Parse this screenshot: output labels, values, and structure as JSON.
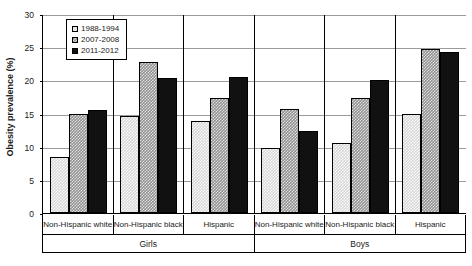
{
  "chart_data": {
    "type": "bar",
    "title": "",
    "xlabel": "",
    "ylabel": "Obesity prevalence (%)",
    "ylim": [
      0,
      30
    ],
    "ytick_step": 5,
    "yticks": [
      0,
      5,
      10,
      15,
      20,
      25,
      30
    ],
    "grid": true,
    "legend_position": "top-left-inside",
    "categories": [
      "Non-Hispanic white",
      "Non-Hispanic black",
      "Hispanic",
      "Non-Hispanic white",
      "Non-Hispanic black",
      "Hispanic"
    ],
    "group_labels": [
      "Girls",
      "Boys"
    ],
    "group_spans": [
      3,
      3
    ],
    "series": [
      {
        "name": "1988-1994",
        "swatch": "light-checker",
        "values": [
          8.4,
          14.6,
          13.8,
          9.8,
          10.6,
          15.0
        ]
      },
      {
        "name": "2007-2008",
        "swatch": "dark-checker",
        "values": [
          15.0,
          22.8,
          17.3,
          15.7,
          17.4,
          24.7
        ]
      },
      {
        "name": "2011-2012",
        "swatch": "solid-black",
        "values": [
          15.6,
          20.4,
          20.5,
          12.4,
          20.0,
          24.3
        ]
      }
    ]
  },
  "colors": {
    "series_1": "#d6d6d6",
    "series_2": "#8f8f8f",
    "series_3": "#111111",
    "axis": "#000000",
    "gridline": "#9b9b9b",
    "background": "#ffffff"
  }
}
